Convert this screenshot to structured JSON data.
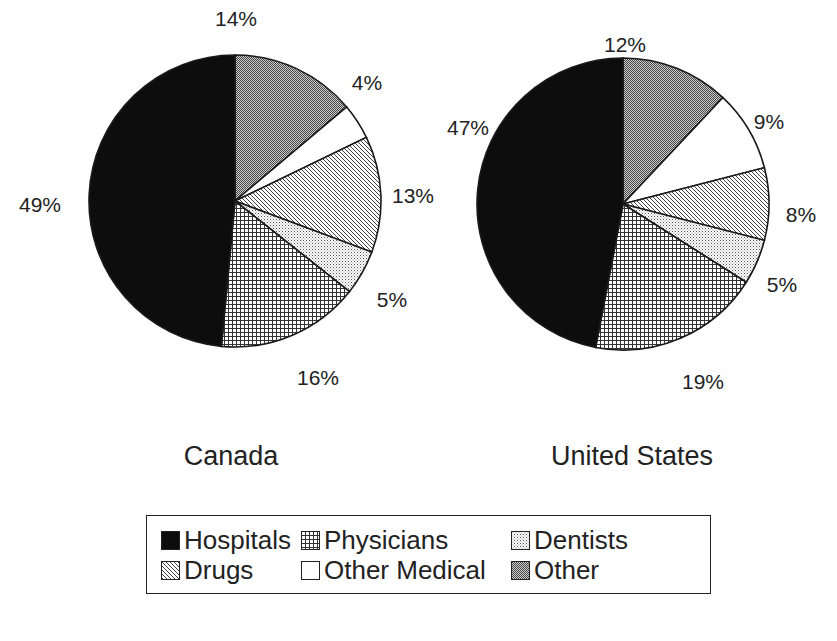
{
  "chart_data": [
    {
      "type": "pie",
      "title": "Canada",
      "start_angle_deg": 0,
      "direction": "clockwise",
      "categories": [
        "Other",
        "Other Medical",
        "Drugs",
        "Dentists",
        "Physicians",
        "Hospitals"
      ],
      "values": [
        14,
        4,
        13,
        5,
        16,
        49
      ],
      "labels": [
        "14%",
        "4%",
        "13%",
        "5%",
        "16%",
        "49%"
      ]
    },
    {
      "type": "pie",
      "title": "United States",
      "start_angle_deg": 0,
      "direction": "clockwise",
      "categories": [
        "Other",
        "Other Medical",
        "Drugs",
        "Dentists",
        "Physicians",
        "Hospitals"
      ],
      "values": [
        12,
        9,
        8,
        5,
        19,
        47
      ],
      "labels": [
        "12%",
        "9%",
        "8%",
        "5%",
        "19%",
        "47%"
      ]
    }
  ],
  "pies": [
    {
      "title": "Canada",
      "cx": 235,
      "cy": 201,
      "r": 146,
      "label_positions": [
        [
          236,
          19
        ],
        [
          367,
          83
        ],
        [
          413,
          196
        ],
        [
          392,
          300
        ],
        [
          318,
          378
        ],
        [
          40,
          205
        ]
      ]
    },
    {
      "title": "United States",
      "cx": 623,
      "cy": 204,
      "r": 146,
      "label_positions": [
        [
          625,
          45
        ],
        [
          769,
          122
        ],
        [
          801,
          215
        ],
        [
          782,
          285
        ],
        [
          703,
          382
        ],
        [
          468,
          128
        ]
      ]
    }
  ],
  "legend": {
    "items": [
      {
        "label": "Hospitals",
        "pattern": "hospitals"
      },
      {
        "label": "Physicians",
        "pattern": "physicians"
      },
      {
        "label": "Dentists",
        "pattern": "dentists"
      },
      {
        "label": "Drugs",
        "pattern": "drugs"
      },
      {
        "label": "Other Medical",
        "pattern": "other-medical"
      },
      {
        "label": "Other",
        "pattern": "other"
      }
    ]
  },
  "colors": {
    "outline": "#1a1a1a",
    "hospitals": "#0d0d0d",
    "background": "#ffffff"
  }
}
